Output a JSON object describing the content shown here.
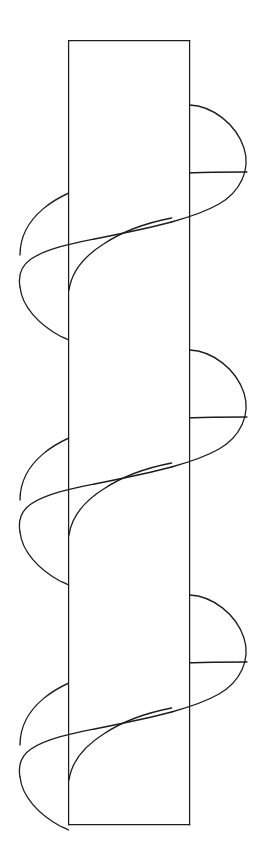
{
  "figure": {
    "title": "Helix wrapped around a rectangular band",
    "kind": "line-drawing",
    "background_color": "#ffffff",
    "stroke_color": "#1c1c1c",
    "canvas": {
      "width": 267,
      "height": 856
    }
  },
  "band": {
    "name": "rectangular-band",
    "left_x": 68,
    "right_x": 190,
    "top_y": 40,
    "bottom_y": 825,
    "width": 122,
    "height": 785,
    "stroke_width": 1.25,
    "edges": [
      "top",
      "right",
      "bottom",
      "left"
    ]
  },
  "helix": {
    "name": "helical-curve",
    "turns": 3,
    "period_px": 245,
    "left_extreme_x": 20,
    "right_extreme_x": 247,
    "amplitude_px": 113.5,
    "center_x": 133.5,
    "first_right_lobe_top_y": 105,
    "first_left_lobe_top_y": 215,
    "stroke_width": 1.3,
    "occlusion": "back strands hidden behind band between x=68 and x=190"
  }
}
